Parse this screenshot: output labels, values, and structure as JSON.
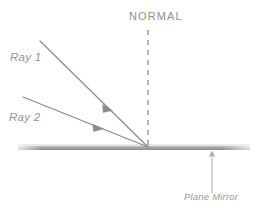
{
  "diagram": {
    "canvas": {
      "width": 263,
      "height": 215,
      "background": "#ffffff"
    },
    "labels": {
      "normal": "NORMAL",
      "ray1": "Ray 1",
      "ray2": "Ray 2",
      "plane_mirror": "Plane Mirror"
    },
    "colors": {
      "ray_stroke": "#8a8a8a",
      "normal_dash": "#9a9a9a",
      "mirror_top": "#f2f2f2",
      "mirror_mid": "#a8a8a8",
      "mirror_bottom": "#8e8e8e",
      "text": "#8d8d8d",
      "pointer": "#a0a0a0"
    },
    "geometry": {
      "incidence_point": {
        "x": 148,
        "y": 147
      },
      "ray1": {
        "start": {
          "x": 40,
          "y": 41
        },
        "end": {
          "x": 148,
          "y": 147
        },
        "arrow_at": {
          "x": 108,
          "y": 107
        }
      },
      "ray2": {
        "start": {
          "x": 23,
          "y": 97
        },
        "end": {
          "x": 148,
          "y": 147
        },
        "arrow_at": {
          "x": 98,
          "y": 127
        }
      },
      "normal_line": {
        "x": 148,
        "y_top": 30,
        "y_bottom": 146,
        "dash_pattern": "5 5"
      },
      "mirror": {
        "x_left": 18,
        "x_right": 250,
        "y_top": 144.5,
        "height": 5.5
      },
      "mirror_pointer": {
        "x": 212,
        "y_tail": 193,
        "y_head": 152
      }
    }
  }
}
